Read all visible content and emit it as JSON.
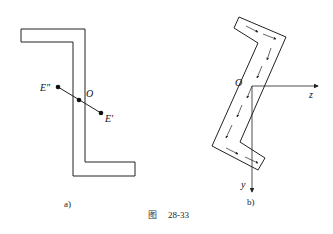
{
  "figure": {
    "caption_prefix": "图",
    "caption_number": "28-33"
  },
  "panel_a": {
    "label": "a)",
    "points": {
      "e_double_prime": "E\"",
      "o": "O",
      "e_prime": "E′"
    }
  },
  "panel_b": {
    "label": "b)",
    "origin": "O",
    "axis_z": "z",
    "axis_y": "y"
  },
  "colors": {
    "line": "#222222",
    "background": "#ffffff"
  }
}
